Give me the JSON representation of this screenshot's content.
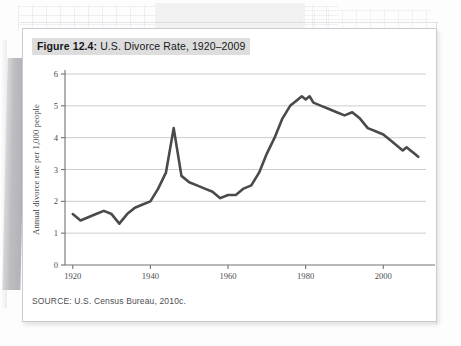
{
  "figure": {
    "caption_label": "Figure 12.4:",
    "caption_text": " U.S. Divorce Rate, 1920–2009",
    "source": "SOURCE: U.S. Census Bureau, 2010c."
  },
  "colors": {
    "line": "#4a4a4a",
    "gridline": "#c4c7cc",
    "axis": "#6f7276",
    "caption_highlight": "#dddddd",
    "card_background": "#ffffff",
    "page_background": "#fdfdfd"
  },
  "axes": {
    "y_title": "Annual divorce rate per 1,000 people",
    "y_ticks": [
      "0",
      "1",
      "2",
      "3",
      "4",
      "5",
      "6"
    ],
    "x_ticks": [
      "1920",
      "1940",
      "1960",
      "1980",
      "2000"
    ]
  },
  "chart_data": {
    "type": "line",
    "title": "U.S. Divorce Rate, 1920–2009",
    "xlabel": "",
    "ylabel": "Annual divorce rate per 1,000 people",
    "xlim": [
      1918,
      2011
    ],
    "ylim": [
      0,
      6
    ],
    "xticks": [
      1920,
      1940,
      1960,
      1980,
      2000
    ],
    "yticks": [
      0,
      1,
      2,
      3,
      4,
      5,
      6
    ],
    "grid": "horizontal",
    "legend": "none",
    "source": "U.S. Census Bureau, 2010c.",
    "series": [
      {
        "name": "Annual divorce rate per 1,000 people",
        "x": [
          1920,
          1922,
          1924,
          1926,
          1928,
          1930,
          1932,
          1934,
          1936,
          1938,
          1940,
          1942,
          1944,
          1946,
          1948,
          1950,
          1952,
          1954,
          1956,
          1958,
          1960,
          1962,
          1964,
          1966,
          1968,
          1970,
          1972,
          1974,
          1976,
          1978,
          1979,
          1980,
          1981,
          1982,
          1984,
          1986,
          1988,
          1990,
          1992,
          1994,
          1996,
          1998,
          2000,
          2002,
          2004,
          2005,
          2006,
          2007,
          2008,
          2009
        ],
        "values": [
          1.6,
          1.4,
          1.5,
          1.6,
          1.7,
          1.6,
          1.3,
          1.6,
          1.8,
          1.9,
          2.0,
          2.4,
          2.9,
          4.3,
          2.8,
          2.6,
          2.5,
          2.4,
          2.3,
          2.1,
          2.2,
          2.2,
          2.4,
          2.5,
          2.9,
          3.5,
          4.0,
          4.6,
          5.0,
          5.2,
          5.3,
          5.2,
          5.3,
          5.1,
          5.0,
          4.9,
          4.8,
          4.7,
          4.8,
          4.6,
          4.3,
          4.2,
          4.1,
          3.9,
          3.7,
          3.6,
          3.7,
          3.6,
          3.5,
          3.4
        ]
      }
    ]
  }
}
